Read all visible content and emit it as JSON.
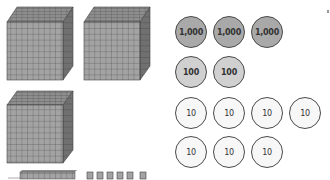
{
  "base_ten_blocks": {
    "thousand_cubes": [
      {
        "x": 7,
        "y": 7
      },
      {
        "x": 84,
        "y": 7
      },
      {
        "x": 7,
        "y": 90
      }
    ],
    "ten_rods": [
      {
        "x": 20,
        "y": 171
      }
    ],
    "unit_cubes": [
      {
        "x": 87,
        "y": 171
      },
      {
        "x": 97,
        "y": 171
      },
      {
        "x": 107,
        "y": 171
      },
      {
        "x": 117,
        "y": 171
      },
      {
        "x": 127,
        "y": 171
      },
      {
        "x": 139,
        "y": 171
      }
    ],
    "colors": {
      "face": "#a0a0a0",
      "grid": "#555555",
      "side": "#6e6e6e",
      "top": "#8c8c8c"
    }
  },
  "place_value_disks": {
    "thousands": {
      "label": "1,000",
      "count": 3,
      "color": "#a9a9a9"
    },
    "hundreds": {
      "label": "100",
      "count": 2,
      "color": "#d0d0d0"
    },
    "tens": {
      "label": "10",
      "count": 7,
      "color": "#f7f7f7"
    },
    "rows": [
      {
        "value": "1,000",
        "disks": [
          {
            "x": 175,
            "y": 16
          },
          {
            "x": 213,
            "y": 16
          },
          {
            "x": 251,
            "y": 16
          }
        ]
      },
      {
        "value": "100",
        "disks": [
          {
            "x": 175,
            "y": 56
          },
          {
            "x": 213,
            "y": 56
          }
        ]
      },
      {
        "value": "10",
        "disks": [
          {
            "x": 175,
            "y": 97
          },
          {
            "x": 213,
            "y": 97
          },
          {
            "x": 251,
            "y": 97
          },
          {
            "x": 289,
            "y": 97
          }
        ]
      },
      {
        "value": "10",
        "disks": [
          {
            "x": 175,
            "y": 136
          },
          {
            "x": 213,
            "y": 136
          },
          {
            "x": 251,
            "y": 136
          }
        ]
      }
    ]
  }
}
